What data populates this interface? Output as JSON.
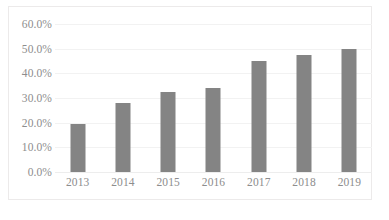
{
  "chart_data": {
    "type": "bar",
    "title": "",
    "subtitle": "",
    "xlabel": "",
    "ylabel": "",
    "categories": [
      "2013",
      "2014",
      "2015",
      "2016",
      "2017",
      "2018",
      "2019"
    ],
    "values": [
      19.5,
      28.0,
      32.5,
      34.0,
      45.0,
      47.5,
      50.0
    ],
    "value_labels": [
      "19.5%",
      "28.0%",
      "32.5%",
      "34.0%",
      "45.0%",
      "47.5%",
      "50.0%"
    ],
    "ylim": [
      0,
      60
    ],
    "ytick_values": [
      60,
      50,
      40,
      30,
      20,
      10,
      0
    ],
    "ytick_labels": [
      "60.0%",
      "50.0%",
      "40.0%",
      "30.0%",
      "20.0%",
      "10.0%",
      "0.0%"
    ],
    "grid": true,
    "legend": false,
    "legend_position": "none",
    "series": [
      {
        "name": "",
        "values": [
          19.5,
          28.0,
          32.5,
          34.0,
          45.0,
          47.5,
          50.0
        ]
      }
    ],
    "colors": {
      "bar_fill": "#848484",
      "gridline": "#f2f2f2",
      "axis_line": "#ededed",
      "tick_label": "#8d8d8d",
      "plot_border": "#eceaea",
      "background": "#ffffff"
    }
  }
}
